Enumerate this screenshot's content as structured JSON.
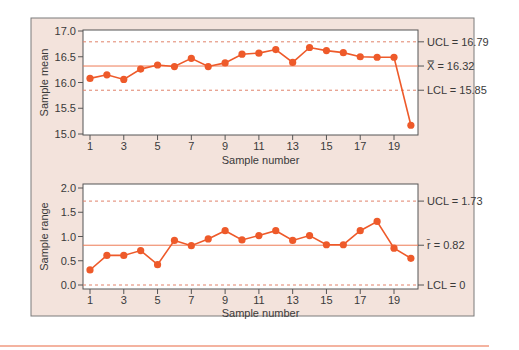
{
  "colors": {
    "panel_bg": "#f3e3dc",
    "panel_border": "#7a7a7a",
    "plot_bg": "#ffffff",
    "series": "#ee5a2a",
    "center_line": "#ee7a55",
    "limit_line": "#e0826a",
    "bottom_rule": "#f09a80",
    "text": "#3a3a3a"
  },
  "chart_data": [
    {
      "type": "line",
      "title": "",
      "xlabel": "Sample number",
      "ylabel": "Sample mean",
      "x": [
        1,
        2,
        3,
        4,
        5,
        6,
        7,
        8,
        9,
        10,
        11,
        12,
        13,
        14,
        15,
        16,
        17,
        18,
        19,
        20
      ],
      "x_ticks": [
        "1",
        "3",
        "5",
        "7",
        "9",
        "11",
        "13",
        "15",
        "17",
        "19"
      ],
      "x_tick_values": [
        1,
        3,
        5,
        7,
        9,
        11,
        13,
        15,
        17,
        19
      ],
      "y_ticks": [
        "15.0",
        "15.5",
        "16.0",
        "16.5",
        "17.0"
      ],
      "y_tick_values": [
        15.0,
        15.5,
        16.0,
        16.5,
        17.0
      ],
      "ylim": [
        15.0,
        17.0
      ],
      "values": [
        16.08,
        16.15,
        16.06,
        16.26,
        16.34,
        16.31,
        16.47,
        16.31,
        16.38,
        16.55,
        16.57,
        16.64,
        16.39,
        16.68,
        16.62,
        16.58,
        16.5,
        16.49,
        16.49,
        15.17
      ],
      "center_line": {
        "value": 16.32,
        "label": "X̿ = 16.32"
      },
      "ucl": {
        "value": 16.79,
        "label": "UCL = 16.79"
      },
      "lcl": {
        "value": 15.85,
        "label": "LCL = 15.85"
      },
      "grid": false
    },
    {
      "type": "line",
      "title": "",
      "xlabel": "Sample number",
      "ylabel": "Sample range",
      "x": [
        1,
        2,
        3,
        4,
        5,
        6,
        7,
        8,
        9,
        10,
        11,
        12,
        13,
        14,
        15,
        16,
        17,
        18,
        19,
        20
      ],
      "x_ticks": [
        "1",
        "3",
        "5",
        "7",
        "9",
        "11",
        "13",
        "15",
        "17",
        "19"
      ],
      "x_tick_values": [
        1,
        3,
        5,
        7,
        9,
        11,
        13,
        15,
        17,
        19
      ],
      "y_ticks": [
        "0.0",
        "0.5",
        "1.0",
        "1.5",
        "2.0"
      ],
      "y_tick_values": [
        0.0,
        0.5,
        1.0,
        1.5,
        2.0
      ],
      "ylim": [
        0.0,
        2.0
      ],
      "values": [
        0.31,
        0.61,
        0.61,
        0.71,
        0.42,
        0.92,
        0.81,
        0.95,
        1.12,
        0.93,
        1.02,
        1.12,
        0.92,
        1.02,
        0.83,
        0.83,
        1.12,
        1.31,
        0.76,
        0.55
      ],
      "center_line": {
        "value": 0.82,
        "label": "r̄ = 0.82"
      },
      "ucl": {
        "value": 1.73,
        "label": "UCL = 1.73"
      },
      "lcl": {
        "value": 0.0,
        "label": "LCL = 0"
      },
      "grid": false
    }
  ]
}
